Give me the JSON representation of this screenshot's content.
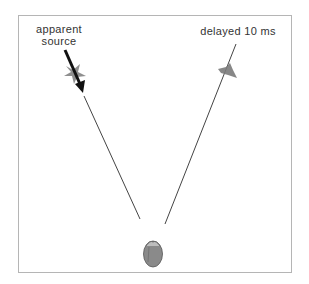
{
  "diagram": {
    "labels": {
      "apparent_line1": "apparent",
      "apparent_line2": "source",
      "delayed": "delayed 10 ms"
    },
    "colors": {
      "frame": "#b5b5b5",
      "line": "#444444",
      "arrow": "#111111",
      "speaker": "#7a7a7a",
      "head": "#8a8a8a"
    },
    "elements": {
      "left_speaker": {
        "x": 75,
        "y": 73
      },
      "right_speaker": {
        "x": 228,
        "y": 72
      },
      "listener_head": {
        "x": 153,
        "y": 254
      }
    }
  }
}
